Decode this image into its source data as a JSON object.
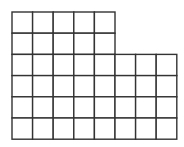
{
  "diagram": {
    "type": "grid-shape",
    "origin": [
      12,
      12
    ],
    "cell_width": 20.6,
    "cell_height": 21.2,
    "rows": [
      {
        "row": 1,
        "cells": 5
      },
      {
        "row": 2,
        "cells": 5
      },
      {
        "row": 3,
        "cells": 8
      },
      {
        "row": 4,
        "cells": 8
      },
      {
        "row": 5,
        "cells": 8
      },
      {
        "row": 6,
        "cells": 8
      }
    ],
    "total_cells": 42,
    "stroke_color": "#333333",
    "background_color": "#ffffff"
  }
}
